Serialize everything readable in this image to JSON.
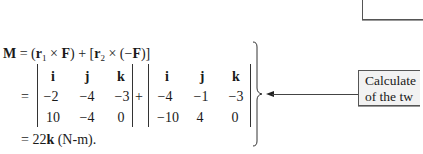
{
  "equation": {
    "line1": {
      "lhs": "M",
      "eq": " = (",
      "r1": "r",
      "r1_sub": "1",
      "times1": " × ",
      "F1": "F",
      "mid": ") + [",
      "r2": "r",
      "r2_sub": "2",
      "times2": " × (−",
      "F2": "F",
      "end": ")]"
    },
    "equals_sign": "=",
    "plus_sign": "+",
    "determinant_1": {
      "rows": [
        [
          "i",
          "j",
          "k"
        ],
        [
          "−2",
          "−4",
          "−3"
        ],
        [
          "10",
          "−4",
          "0"
        ]
      ]
    },
    "determinant_2": {
      "rows": [
        [
          "i",
          "j",
          "k"
        ],
        [
          "−4",
          "−1",
          "−3"
        ],
        [
          "−10",
          "4",
          "0"
        ]
      ]
    },
    "result": {
      "prefix": "= 22",
      "unit_vector": "k",
      "suffix": " (N-m)."
    }
  },
  "callout": {
    "line1": "Calculate",
    "line2": "of the tw"
  }
}
